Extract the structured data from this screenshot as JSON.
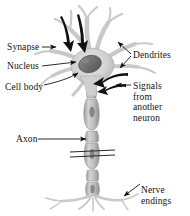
{
  "figure": {
    "background_color": "#ffffff",
    "width": 190,
    "height": 216
  },
  "labels": {
    "synapse": "Synapse",
    "nucleus": "Nucleus",
    "cell_body": "Cell body",
    "axon": "Axon",
    "dendrites": "Dendrites",
    "signals_line1": "Signals",
    "signals_line2": "from",
    "signals_line3": "another",
    "signals_line4": "neuron",
    "nerve_line1": "Nerve",
    "nerve_line2": "endings"
  },
  "colors": {
    "text": "#15120f",
    "leader_line": "#1a1a1a",
    "arrow_dark": "#111111",
    "cell_light": "#dcdcdc",
    "cell_mid": "#b8b8b8",
    "cell_shadow": "#9a9a9a",
    "nucleus": "#6f6f6f",
    "outline": "#8a8a8a"
  },
  "parts": {
    "soma": "cell-body-soma",
    "nucleus": "nucleus-oval",
    "dendrites": "dendrite-branches",
    "axon": "myelinated-axon",
    "break_marks": "axon-break-symbol",
    "terminals": "nerve-ending-branches",
    "incoming_arrows": "signal-input-arrows"
  }
}
